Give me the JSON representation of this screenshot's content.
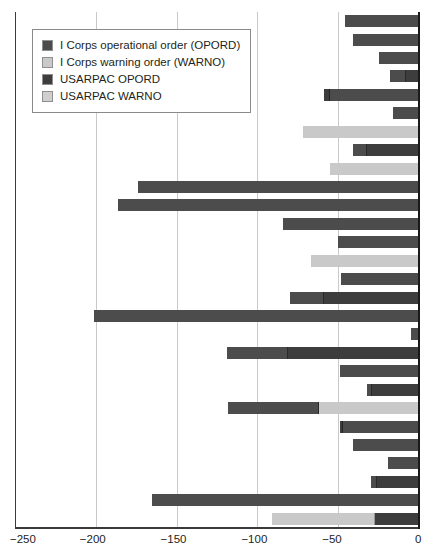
{
  "chart_data": {
    "type": "bar",
    "orientation": "horizontal",
    "stacked": true,
    "title": "",
    "xlabel": "",
    "ylabel": "",
    "xlim": [
      -250,
      0
    ],
    "xticks": [
      -250,
      -200,
      -150,
      -100,
      -50,
      0
    ],
    "xtick_labels": [
      "−250",
      "−200",
      "−150",
      "−100",
      "−50",
      "0"
    ],
    "grid": "vertical",
    "legend_position": "upper-left",
    "series": [
      {
        "name": "I Corps operational order (OPORD)",
        "key": "icorps_opord",
        "color": "#4c4c4c"
      },
      {
        "name": "I Corps warning order (WARNO)",
        "key": "icorps_warno",
        "color": "#c9c9c9"
      },
      {
        "name": "USARPAC OPORD",
        "key": "usarpac_opord",
        "color": "#3d3d3d"
      },
      {
        "name": "USARPAC WARNO",
        "key": "usarpac_warno",
        "color": "#cfcfcf"
      }
    ],
    "categories": [
      "row-1",
      "row-2",
      "row-3",
      "row-4",
      "row-5",
      "row-6",
      "row-7",
      "row-8",
      "row-9",
      "row-10",
      "row-11",
      "row-12",
      "row-13",
      "row-14",
      "row-15",
      "row-16",
      "row-17",
      "row-18",
      "row-19",
      "row-20",
      "row-21",
      "row-22",
      "row-23",
      "row-24",
      "row-25",
      "row-26",
      "row-27",
      "row-28",
      "row-29",
      "row-30"
    ],
    "rows": [
      {
        "start": -46,
        "segments": [
          {
            "key": "icorps_opord",
            "from": -46,
            "to": 0
          }
        ]
      },
      {
        "start": -41,
        "segments": [
          {
            "key": "icorps_opord",
            "from": -41,
            "to": 0
          }
        ]
      },
      {
        "start": -25,
        "segments": [
          {
            "key": "icorps_opord",
            "from": -25,
            "to": 0
          }
        ]
      },
      {
        "start": -18,
        "segments": [
          {
            "key": "icorps_opord",
            "from": -18,
            "to": -8
          },
          {
            "key": "usarpac_opord",
            "from": -8,
            "to": 0
          }
        ]
      },
      {
        "start": -59,
        "segments": [
          {
            "key": "usarpac_opord",
            "from": -59,
            "to": -55
          },
          {
            "key": "icorps_opord",
            "from": -55,
            "to": 0
          }
        ]
      },
      {
        "start": -16,
        "segments": [
          {
            "key": "icorps_opord",
            "from": -16,
            "to": 0
          }
        ]
      },
      {
        "start": -72,
        "segments": [
          {
            "key": "icorps_warno",
            "from": -72,
            "to": 0
          }
        ]
      },
      {
        "start": -41,
        "segments": [
          {
            "key": "icorps_opord",
            "from": -41,
            "to": -32
          },
          {
            "key": "usarpac_opord",
            "from": -32,
            "to": 0
          }
        ]
      },
      {
        "start": -55,
        "segments": [
          {
            "key": "icorps_warno",
            "from": -55,
            "to": 0
          }
        ]
      },
      {
        "start": -174,
        "segments": [
          {
            "key": "icorps_opord",
            "from": -174,
            "to": 0
          }
        ]
      },
      {
        "start": -186,
        "segments": [
          {
            "key": "icorps_opord",
            "from": -186,
            "to": 0
          }
        ]
      },
      {
        "start": -84,
        "segments": [
          {
            "key": "icorps_opord",
            "from": -84,
            "to": 0
          }
        ]
      },
      {
        "start": -50,
        "segments": [
          {
            "key": "icorps_opord",
            "from": -50,
            "to": 0
          }
        ]
      },
      {
        "start": -67,
        "segments": [
          {
            "key": "icorps_warno",
            "from": -67,
            "to": 0
          }
        ]
      },
      {
        "start": -48,
        "segments": [
          {
            "key": "icorps_opord",
            "from": -48,
            "to": 0
          }
        ]
      },
      {
        "start": -80,
        "segments": [
          {
            "key": "icorps_opord",
            "from": -80,
            "to": -59
          },
          {
            "key": "usarpac_opord",
            "from": -59,
            "to": 0
          }
        ]
      },
      {
        "start": -201,
        "segments": [
          {
            "key": "icorps_opord",
            "from": -201,
            "to": 0
          }
        ]
      },
      {
        "start": -5,
        "segments": [
          {
            "key": "icorps_opord",
            "from": -5,
            "to": 0
          }
        ]
      },
      {
        "start": -119,
        "segments": [
          {
            "key": "icorps_opord",
            "from": -119,
            "to": -81
          },
          {
            "key": "usarpac_opord",
            "from": -81,
            "to": 0
          }
        ]
      },
      {
        "start": -49,
        "segments": [
          {
            "key": "icorps_opord",
            "from": -49,
            "to": 0
          }
        ]
      },
      {
        "start": -32,
        "segments": [
          {
            "key": "icorps_opord",
            "from": -32,
            "to": -29
          },
          {
            "key": "usarpac_opord",
            "from": -29,
            "to": 0
          }
        ]
      },
      {
        "start": -118,
        "segments": [
          {
            "key": "icorps_opord",
            "from": -118,
            "to": -62
          },
          {
            "key": "icorps_warno",
            "from": -62,
            "to": 0
          }
        ]
      },
      {
        "start": -49,
        "segments": [
          {
            "key": "usarpac_opord",
            "from": -49,
            "to": -47
          },
          {
            "key": "icorps_opord",
            "from": -47,
            "to": 0
          }
        ]
      },
      {
        "start": -41,
        "segments": [
          {
            "key": "icorps_opord",
            "from": -41,
            "to": 0
          }
        ]
      },
      {
        "start": -19,
        "segments": [
          {
            "key": "icorps_opord",
            "from": -19,
            "to": 0
          }
        ]
      },
      {
        "start": -30,
        "segments": [
          {
            "key": "icorps_opord",
            "from": -30,
            "to": -26
          },
          {
            "key": "usarpac_opord",
            "from": -26,
            "to": 0
          }
        ]
      },
      {
        "start": -165,
        "segments": [
          {
            "key": "icorps_opord",
            "from": -165,
            "to": 0
          }
        ]
      },
      {
        "start": -91,
        "segments": [
          {
            "key": "icorps_warno",
            "from": -91,
            "to": -27
          },
          {
            "key": "usarpac_opord",
            "from": -27,
            "to": 0
          }
        ]
      }
    ]
  },
  "legend": {
    "items": [
      {
        "label": "I Corps operational order (OPORD)",
        "swatch": "#4c4c4c",
        "name": "legend-swatch-icorps-opord"
      },
      {
        "label": "I Corps warning order (WARNO)",
        "swatch": "#c9c9c9",
        "name": "legend-swatch-icorps-warno"
      },
      {
        "label": "USARPAC OPORD",
        "swatch": "#3d3d3d",
        "name": "legend-swatch-usarpac-opord"
      },
      {
        "label": "USARPAC WARNO",
        "swatch": "#cfcfcf",
        "name": "legend-swatch-usarpac-warno"
      }
    ]
  }
}
